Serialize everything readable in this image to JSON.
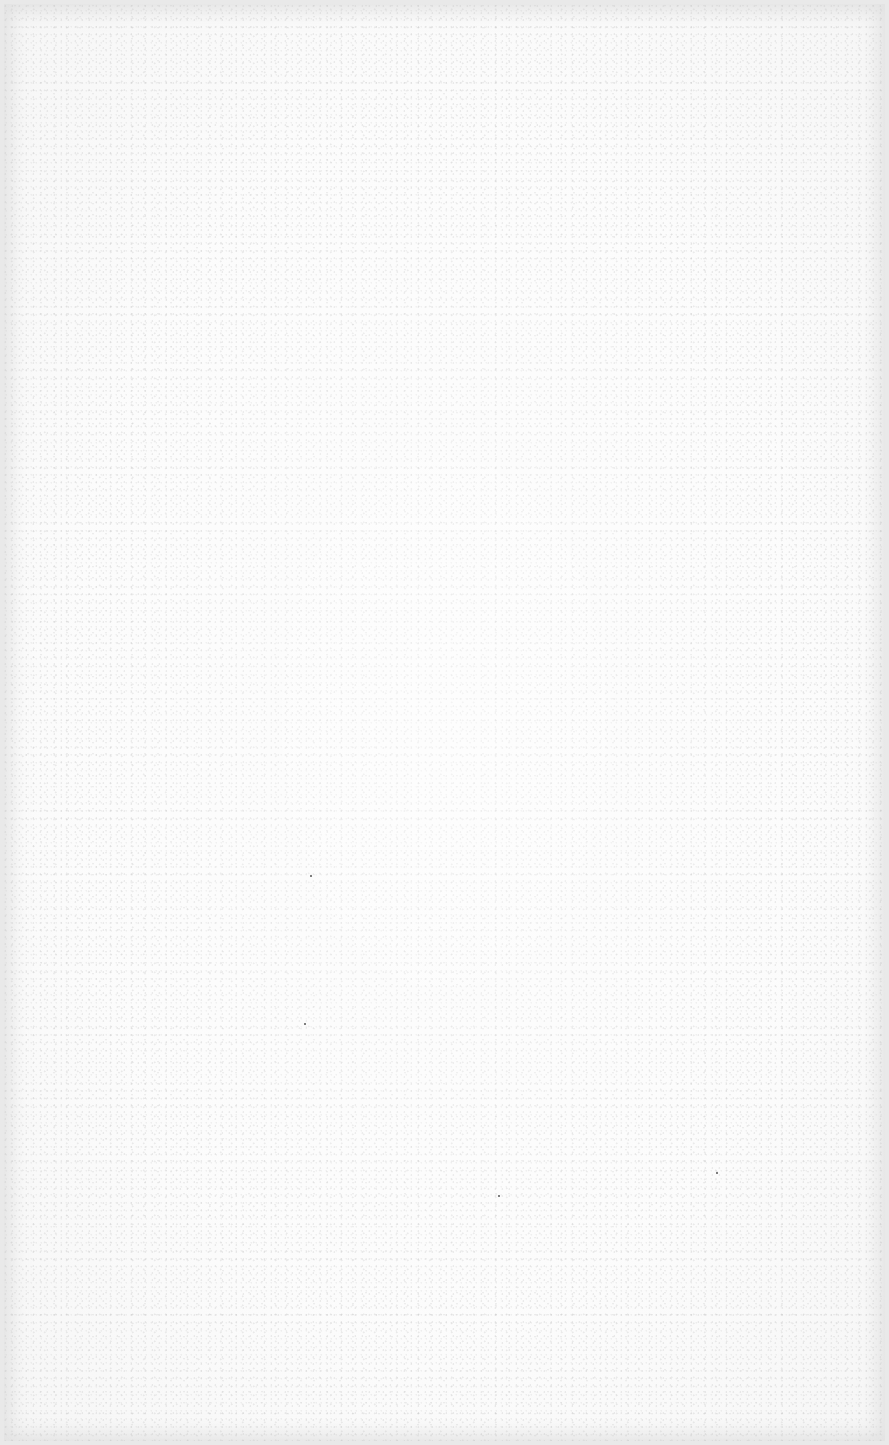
{
  "document": {
    "type": "blank-page",
    "background_color": "#fbfbfb",
    "border_color": "#e9e9e9",
    "text_content": []
  },
  "specks": [
    {
      "x": 310,
      "y": 875
    },
    {
      "x": 304,
      "y": 1023
    },
    {
      "x": 498,
      "y": 1195
    },
    {
      "x": 716,
      "y": 1172
    }
  ]
}
